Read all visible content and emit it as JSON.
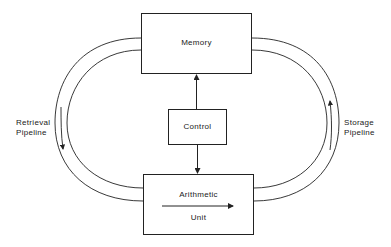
{
  "diagram": {
    "nodes": {
      "memory": {
        "label": "Memory"
      },
      "control": {
        "label": "Control"
      },
      "arithmetic": {
        "label_top": "Arithmetic",
        "label_bottom": "Unit"
      }
    },
    "pipelines": {
      "retrieval": {
        "line1": "Retrieval",
        "line2": "Pipeline",
        "direction": "down"
      },
      "storage": {
        "line1": "Storage",
        "line2": "Pipeline",
        "direction": "up"
      }
    },
    "edges": [
      {
        "from": "control",
        "to": "memory"
      },
      {
        "from": "control",
        "to": "arithmetic"
      },
      {
        "from": "memory",
        "to": "arithmetic",
        "via": "retrieval"
      },
      {
        "from": "arithmetic",
        "to": "memory",
        "via": "storage"
      }
    ],
    "colors": {
      "stroke": "#222222",
      "background": "#ffffff"
    }
  }
}
